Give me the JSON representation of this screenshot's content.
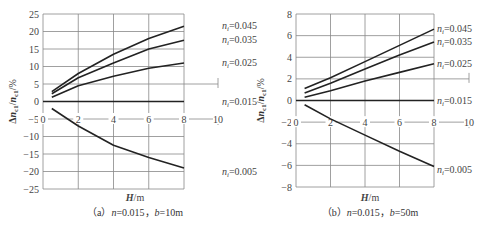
{
  "chart_data": [
    {
      "type": "line",
      "title": "(a) n=0.015, b=10m",
      "caption_prefix": "(a)",
      "caption_n": "n=0.015",
      "caption_b": "b=10m",
      "xlabel": "H/m",
      "ylabel": "Δn_c1/n_c1/%",
      "xlim": [
        0,
        10
      ],
      "ylim": [
        -25,
        25
      ],
      "xticks": [
        0,
        2,
        4,
        6,
        8,
        10
      ],
      "yticks": [
        25,
        20,
        15,
        10,
        5,
        0,
        -5,
        -10,
        -15,
        -20,
        -25
      ],
      "grid": true,
      "x": [
        0.5,
        2,
        4,
        6,
        8
      ],
      "series": [
        {
          "name": "n_i=0.045",
          "values": [
            2.8,
            8.0,
            13.5,
            18.0,
            21.5
          ]
        },
        {
          "name": "n_i=0.035",
          "values": [
            2.2,
            6.8,
            11.0,
            15.0,
            17.5
          ]
        },
        {
          "name": "n_i=0.025",
          "values": [
            1.2,
            4.5,
            7.2,
            9.5,
            11.0
          ]
        },
        {
          "name": "n_i=0.015",
          "values": [
            0,
            0,
            0,
            0,
            0
          ]
        },
        {
          "name": "n_i=0.005",
          "values": [
            -2.0,
            -7.0,
            -12.5,
            -16.0,
            -19.0
          ]
        }
      ]
    },
    {
      "type": "line",
      "title": "(b) n=0.015, b=50m",
      "caption_prefix": "(b)",
      "caption_n": "n=0.015",
      "caption_b": "b=50m",
      "xlabel": "H/m",
      "ylabel": "Δn_c1/n_c1/%",
      "xlim": [
        0,
        10
      ],
      "ylim": [
        -8,
        8
      ],
      "xticks": [
        0,
        2,
        4,
        6,
        8,
        10
      ],
      "yticks": [
        8,
        6,
        4,
        2,
        0,
        -2,
        -4,
        -6,
        -8
      ],
      "grid": true,
      "x": [
        0.5,
        2,
        4,
        6,
        8
      ],
      "series": [
        {
          "name": "n_i=0.045",
          "values": [
            1.1,
            2.1,
            3.6,
            5.1,
            6.6
          ]
        },
        {
          "name": "n_i=0.035",
          "values": [
            0.7,
            1.6,
            2.9,
            4.2,
            5.4
          ]
        },
        {
          "name": "n_i=0.025",
          "values": [
            0.3,
            0.9,
            1.8,
            2.6,
            3.4
          ]
        },
        {
          "name": "n_i=0.015",
          "values": [
            0,
            0,
            0,
            0,
            0
          ]
        },
        {
          "name": "n_i=0.005",
          "values": [
            -0.4,
            -1.7,
            -3.2,
            -4.7,
            -6.1
          ]
        }
      ]
    }
  ]
}
